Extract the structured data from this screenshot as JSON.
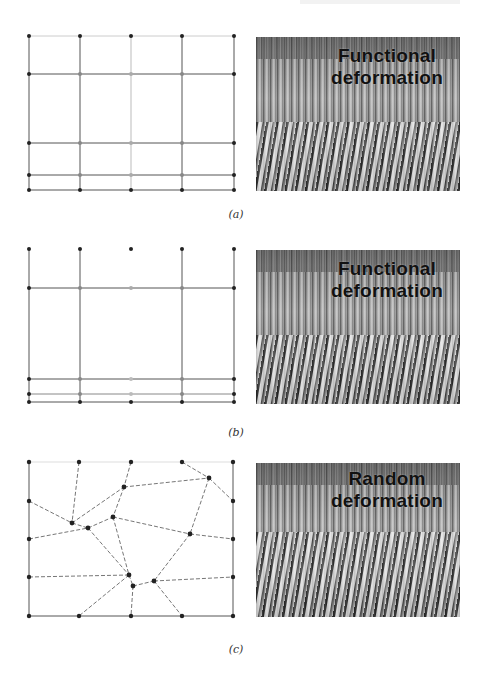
{
  "figure": {
    "panels": [
      {
        "id": "a",
        "caption": "(a)",
        "photo_label_line1": "Functional",
        "photo_label_line2": "deformation",
        "mesh": {
          "type": "rectilinear-grid",
          "columns_x": [
            29,
            80,
            131,
            182,
            234
          ],
          "rows_y": [
            36,
            74,
            143,
            175,
            190
          ]
        }
      },
      {
        "id": "b",
        "caption": "(b)",
        "photo_label_line1": "Functional",
        "photo_label_line2": "deformation",
        "mesh": {
          "type": "rectilinear-grid",
          "columns_x": [
            29,
            80,
            131,
            182,
            234
          ],
          "rows_y": [
            249,
            288,
            379,
            394,
            402
          ]
        }
      },
      {
        "id": "c",
        "caption": "(c)",
        "photo_label_line1": "Random",
        "photo_label_line2": "deformation",
        "mesh": {
          "type": "random-mesh",
          "node_count": 27
        }
      }
    ]
  }
}
